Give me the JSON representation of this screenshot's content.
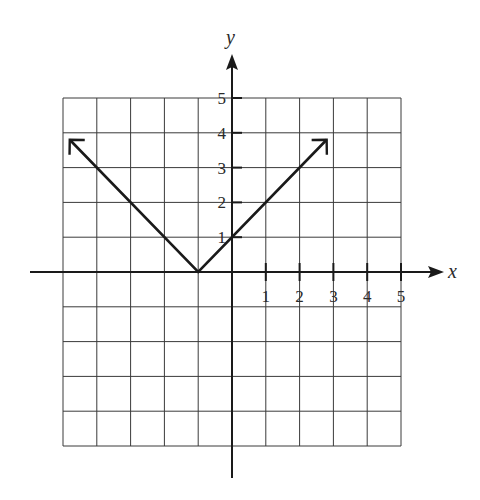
{
  "chart_data": {
    "type": "line",
    "title": "",
    "function": "y = |x + 1|",
    "xlabel": "x",
    "ylabel": "y",
    "xlim": [
      -5,
      5
    ],
    "ylim": [
      -5,
      5
    ],
    "grid": true,
    "x_tick_labels": [
      "1",
      "2",
      "3",
      "4",
      "5"
    ],
    "y_tick_labels": [
      "1",
      "2",
      "3",
      "4",
      "5"
    ],
    "series": [
      {
        "name": "absolute value graph",
        "x": [
          -4.8,
          -1,
          2.8
        ],
        "y": [
          3.8,
          0,
          3.8
        ],
        "arrows_at_ends": true
      }
    ],
    "annotations": {
      "vertex": [
        -1,
        0
      ],
      "y_intercept": [
        0,
        1
      ]
    },
    "colors": {
      "grid": "#3a3a3a",
      "axis": "#1a1a1a",
      "line": "#1a1a1a"
    }
  }
}
